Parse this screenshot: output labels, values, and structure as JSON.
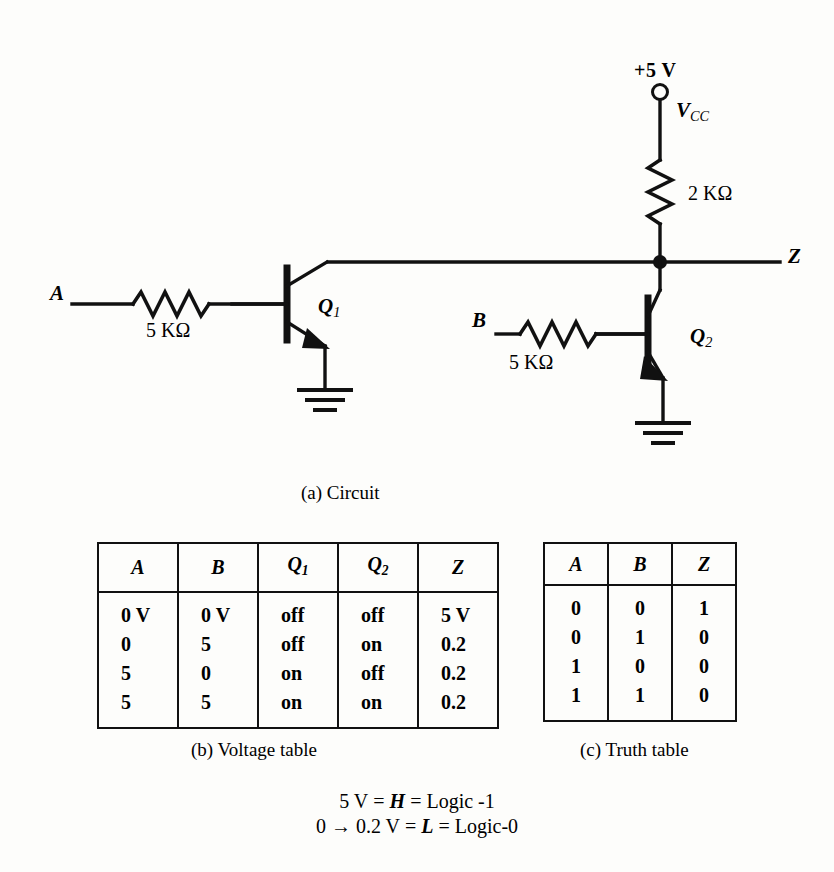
{
  "figure": {
    "captions": {
      "circuit": "(a)  Circuit",
      "voltage_table": "(b)  Voltage table",
      "truth_table": "(c)  Truth table"
    }
  },
  "circuit": {
    "supply_label": "+5 V",
    "supply_symbol": "V",
    "supply_symbol_sub": "CC",
    "pullup_resistor": "2 KΩ",
    "output_label": "Z",
    "input_a_label": "A",
    "input_a_resistor": "5 KΩ",
    "input_b_label": "B",
    "input_b_resistor": "5 KΩ",
    "transistor_1": "Q",
    "transistor_1_sub": "1",
    "transistor_2": "Q",
    "transistor_2_sub": "2",
    "ink_color": "#111111"
  },
  "voltage_table": {
    "headers": [
      {
        "text": "A",
        "sub": ""
      },
      {
        "text": "B",
        "sub": ""
      },
      {
        "text": "Q",
        "sub": "1"
      },
      {
        "text": "Q",
        "sub": "2"
      },
      {
        "text": "Z",
        "sub": ""
      }
    ],
    "rows": [
      [
        "0 V",
        "0 V",
        "off",
        "off",
        "5 V"
      ],
      [
        "0",
        "5",
        "off",
        "on",
        "0.2"
      ],
      [
        "5",
        "0",
        "on",
        "off",
        "0.2"
      ],
      [
        "5",
        "5",
        "on",
        "on",
        "0.2"
      ]
    ]
  },
  "truth_table": {
    "headers": [
      "A",
      "B",
      "Z"
    ],
    "rows": [
      [
        "0",
        "0",
        "1"
      ],
      [
        "0",
        "1",
        "0"
      ],
      [
        "1",
        "0",
        "0"
      ],
      [
        "1",
        "1",
        "0"
      ]
    ]
  },
  "legend": {
    "line1": {
      "value": "5 V",
      "eq1": "=",
      "level": "H",
      "eq2": "=",
      "logic": "Logic -1"
    },
    "line2": {
      "value": "0 → 0.2 V",
      "eq1": "=",
      "level": "L",
      "eq2": "=",
      "logic": "Logic-0"
    }
  }
}
